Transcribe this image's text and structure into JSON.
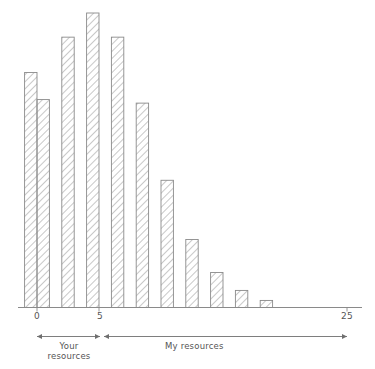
{
  "chart_data": {
    "type": "bar",
    "title": "",
    "subtitle": "",
    "xlabel": "",
    "ylabel": "",
    "grid": false,
    "legend_position": "none",
    "xlim": [
      -1.5,
      25.5
    ],
    "ylim": [
      0,
      1
    ],
    "x_ticks": [
      {
        "value": 0,
        "label": "0"
      },
      {
        "value": 5,
        "label": "5"
      },
      {
        "value": 25,
        "label": "25"
      }
    ],
    "y_axis_visible": false,
    "bar_style": {
      "fill": "hatch-diagonal",
      "stroke": "#8a8a8a",
      "hatch_color": "#9a9a9a"
    },
    "categories": [
      -1,
      0,
      2,
      4,
      6,
      8,
      10,
      12,
      14,
      16,
      18
    ],
    "values": [
      0.798,
      0.706,
      0.918,
      1.0,
      0.918,
      0.694,
      0.432,
      0.231,
      0.119,
      0.058,
      0.024
    ],
    "bars": [
      {
        "x": -1,
        "height": 0.798,
        "width": 1
      },
      {
        "x": 0,
        "height": 0.706,
        "width": 1
      },
      {
        "x": 2,
        "height": 0.918,
        "width": 1
      },
      {
        "x": 4,
        "height": 1.0,
        "width": 1
      },
      {
        "x": 6,
        "height": 0.918,
        "width": 1
      },
      {
        "x": 8,
        "height": 0.694,
        "width": 1
      },
      {
        "x": 10,
        "height": 0.432,
        "width": 1
      },
      {
        "x": 12,
        "height": 0.231,
        "width": 1
      },
      {
        "x": 14,
        "height": 0.119,
        "width": 1
      },
      {
        "x": 16,
        "height": 0.058,
        "width": 1
      },
      {
        "x": 18,
        "height": 0.024,
        "width": 1
      }
    ],
    "annotations": [
      {
        "name": "your-resources-bracket",
        "label": "Your\nresources",
        "from": 0,
        "to": 5
      },
      {
        "name": "my-resources-bracket",
        "label": "My resources",
        "from": 5,
        "to": 25
      }
    ]
  },
  "axis": {
    "tick_0": "0",
    "tick_5": "5",
    "tick_25": "25"
  },
  "brackets": {
    "your_line1": "Your",
    "your_line2": "resources",
    "my": "My resources"
  },
  "colors": {
    "axis": "#8a8a8a",
    "bar_stroke": "#8a8a8a",
    "hatch": "#9a9a9a",
    "text": "#555555",
    "background": "#ffffff"
  }
}
